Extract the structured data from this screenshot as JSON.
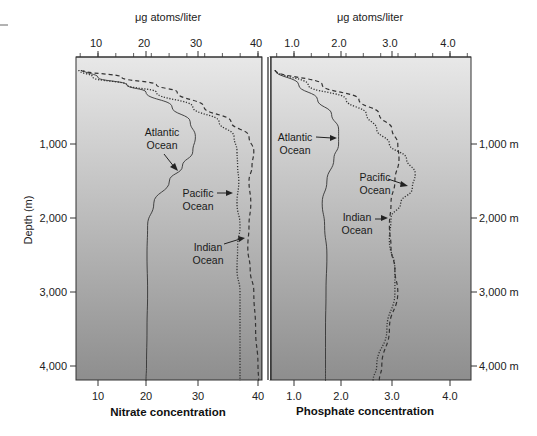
{
  "figure": {
    "left_panel": {
      "top_axis_unit": "μg atoms/liter",
      "xlabel": "Nitrate concentration",
      "ticks": [
        "10",
        "20",
        "30",
        "40"
      ]
    },
    "right_panel": {
      "top_axis_unit": "μg atoms/liter",
      "xlabel": "Phosphate concentration",
      "ticks": [
        "1.0",
        "2.0",
        "3.0",
        "4.0"
      ]
    },
    "left_yaxis": {
      "label": "Depth (m)",
      "ticks": [
        "1,000",
        "2,000",
        "3,000",
        "4,000"
      ]
    },
    "right_yaxis": {
      "ticks": [
        "1,000 m",
        "2,000 m",
        "3,000 m",
        "4,000 m"
      ]
    },
    "annotations": {
      "nitrate_atlantic": [
        "Atlantic",
        "Ocean"
      ],
      "nitrate_pacific": [
        "Pacific",
        "Ocean"
      ],
      "nitrate_indian": [
        "Indian",
        "Ocean"
      ],
      "phosphate_atlantic": [
        "Atlantic",
        "Ocean"
      ],
      "phosphate_pacific": [
        "Pacific",
        "Ocean"
      ],
      "phosphate_indian": [
        "Indian",
        "Ocean"
      ]
    },
    "colors": {
      "background_top": "#e8e8e8",
      "background_bottom": "#8e8e8e",
      "line": "#333333"
    }
  },
  "chart_data": [
    {
      "type": "line",
      "title": "Nitrate concentration",
      "xlabel": "Nitrate concentration (μg atoms/liter)",
      "ylabel": "Depth (m)",
      "xlim": [
        6,
        43
      ],
      "ylim": [
        4200,
        0
      ],
      "x_ticks": [
        10,
        20,
        30,
        40
      ],
      "y_ticks": [
        1000,
        2000,
        3000,
        4000
      ],
      "orientation": "depth profile (x = concentration, y = depth, inverted)",
      "grid": false,
      "series": [
        {
          "name": "Atlantic Ocean",
          "style": "solid",
          "depth": [
            0,
            100,
            200,
            300,
            500,
            700,
            900,
            1100,
            1300,
            1500,
            1800,
            2100,
            2500,
            3000,
            3500,
            4000,
            4200
          ],
          "values": [
            7,
            10,
            16,
            20,
            25,
            28.5,
            29.5,
            29,
            27,
            24.5,
            21.5,
            20.3,
            20.2,
            20.3,
            20.2,
            20.1,
            20
          ]
        },
        {
          "name": "Pacific Ocean",
          "style": "dotted",
          "depth": [
            0,
            100,
            200,
            300,
            500,
            700,
            900,
            1100,
            1300,
            1500,
            1800,
            2100,
            2400,
            2700,
            3000,
            3500,
            4000,
            4200
          ],
          "values": [
            6,
            9,
            16,
            22,
            29,
            33.5,
            36,
            36.5,
            36.6,
            36.8,
            36.5,
            37,
            36.6,
            36.5,
            37,
            37,
            37,
            37
          ]
        },
        {
          "name": "Indian Ocean",
          "style": "dashed",
          "depth": [
            0,
            100,
            200,
            300,
            500,
            700,
            900,
            1100,
            1300,
            1500,
            1800,
            2100,
            2400,
            2700,
            3000,
            3500,
            4000,
            4200
          ],
          "values": [
            6.5,
            15,
            22,
            26,
            31,
            35.5,
            38.5,
            39.3,
            39,
            38.5,
            38.8,
            38.5,
            38.3,
            38.7,
            39.3,
            39.6,
            40,
            40.1
          ]
        }
      ]
    },
    {
      "type": "line",
      "title": "Phosphate concentration",
      "xlabel": "Phosphate concentration (μg atoms/liter)",
      "ylabel": "Depth (m)",
      "xlim": [
        0.5,
        4.4
      ],
      "ylim": [
        4200,
        0
      ],
      "x_ticks": [
        1.0,
        2.0,
        3.0,
        4.0
      ],
      "y_ticks": [
        1000,
        2000,
        3000,
        4000
      ],
      "orientation": "depth profile (x = concentration, y = depth, inverted)",
      "grid": false,
      "series": [
        {
          "name": "Atlantic Ocean",
          "style": "solid",
          "depth": [
            0,
            200,
            400,
            600,
            800,
            1000,
            1200,
            1500,
            1800,
            2100,
            2500,
            3000,
            3500,
            4000,
            4200
          ],
          "values": [
            0.6,
            1.1,
            1.5,
            1.8,
            1.95,
            1.95,
            1.85,
            1.7,
            1.6,
            1.65,
            1.7,
            1.68,
            1.67,
            1.67,
            1.67
          ]
        },
        {
          "name": "Pacific Ocean",
          "style": "dotted",
          "depth": [
            0,
            200,
            400,
            600,
            800,
            1000,
            1200,
            1400,
            1600,
            1800,
            2000,
            2300,
            2700,
            3000,
            3500,
            4000,
            4200
          ],
          "values": [
            0.6,
            1.3,
            2.1,
            2.5,
            2.7,
            2.95,
            3.25,
            3.4,
            3.35,
            3.15,
            2.98,
            2.95,
            3.05,
            3.05,
            2.9,
            2.7,
            2.63
          ]
        },
        {
          "name": "Indian Ocean",
          "style": "dashed",
          "depth": [
            0,
            200,
            400,
            600,
            800,
            1000,
            1200,
            1500,
            1800,
            2100,
            2400,
            2700,
            3000,
            3500,
            4000,
            4200
          ],
          "values": [
            0.6,
            1.6,
            2.35,
            2.75,
            3.0,
            3.1,
            3.12,
            3.05,
            2.98,
            2.95,
            2.98,
            3.05,
            3.1,
            2.95,
            2.8,
            2.75
          ]
        }
      ]
    }
  ]
}
